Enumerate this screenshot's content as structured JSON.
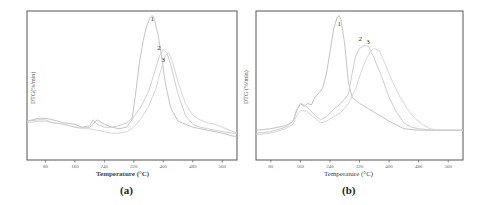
{
  "chart_data": [
    {
      "id": "a",
      "type": "line",
      "caption": "(a)",
      "title": "",
      "xlabel": "Temperature (°C)",
      "ylabel": "DTG(%/min)",
      "xlim": [
        30,
        600
      ],
      "ylim": [
        0,
        100
      ],
      "xticks": [
        80,
        160,
        240,
        320,
        400,
        480,
        560
      ],
      "grid": false,
      "legend": "inline numeric labels near peaks",
      "series": [
        {
          "name": "1",
          "label_position": [
            370,
            93
          ],
          "x": [
            30,
            60,
            80,
            100,
            130,
            160,
            180,
            200,
            210,
            220,
            240,
            260,
            280,
            300,
            315,
            325,
            335,
            345,
            355,
            365,
            370,
            375,
            385,
            395,
            405,
            420,
            440,
            460,
            480,
            500,
            520,
            540,
            560,
            590,
            600
          ],
          "y": [
            26,
            28,
            28,
            27,
            25,
            24,
            22,
            22,
            24,
            27,
            24,
            22,
            21,
            22,
            27,
            45,
            65,
            80,
            90,
            96,
            97,
            95,
            85,
            70,
            52,
            35,
            26,
            24,
            22,
            21,
            20,
            19,
            18,
            16,
            16
          ]
        },
        {
          "name": "2",
          "label_position": [
            388,
            74
          ],
          "x": [
            30,
            60,
            80,
            100,
            130,
            160,
            180,
            200,
            210,
            220,
            240,
            260,
            280,
            300,
            320,
            340,
            360,
            375,
            390,
            400,
            410,
            420,
            440,
            460,
            480,
            500,
            520,
            540,
            560,
            590,
            600
          ],
          "y": [
            26,
            27,
            27,
            25,
            24,
            22,
            22,
            23,
            27,
            24,
            22,
            22,
            23,
            25,
            29,
            36,
            46,
            58,
            70,
            74,
            72,
            64,
            44,
            30,
            24,
            22,
            21,
            20,
            19,
            18,
            18
          ]
        },
        {
          "name": "3",
          "label_position": [
            400,
            66
          ],
          "x": [
            30,
            60,
            80,
            100,
            130,
            160,
            180,
            200,
            220,
            240,
            260,
            280,
            300,
            320,
            340,
            360,
            380,
            395,
            405,
            415,
            425,
            440,
            460,
            480,
            500,
            520,
            540,
            560,
            590,
            600
          ],
          "y": [
            25,
            26,
            26,
            25,
            24,
            22,
            21,
            21,
            20,
            19,
            18,
            18,
            19,
            22,
            28,
            36,
            48,
            62,
            70,
            72,
            66,
            52,
            38,
            30,
            27,
            25,
            24,
            22,
            19,
            18
          ]
        }
      ]
    },
    {
      "id": "b",
      "type": "line",
      "caption": "(b)",
      "title": "",
      "xlabel": "Temperature (°C)",
      "ylabel": "DTG (%/min)",
      "xlim": [
        40,
        600
      ],
      "ylim": [
        0,
        100
      ],
      "xticks": [
        80,
        160,
        240,
        320,
        400,
        480,
        560
      ],
      "grid": false,
      "legend": "inline numeric labels near peaks",
      "series": [
        {
          "name": "1",
          "label_position": [
            265,
            90
          ],
          "x": [
            40,
            80,
            120,
            140,
            150,
            160,
            170,
            180,
            190,
            200,
            210,
            220,
            230,
            240,
            250,
            260,
            265,
            270,
            280,
            290,
            300,
            320,
            360,
            400,
            440,
            480,
            520,
            560,
            600
          ],
          "y": [
            20,
            21,
            23,
            26,
            33,
            38,
            36,
            38,
            37,
            42,
            45,
            48,
            57,
            72,
            88,
            96,
            97,
            94,
            78,
            52,
            42,
            38,
            32,
            26,
            21,
            20,
            20,
            20,
            20
          ],
          "note": "sharp main peak ~265 °C"
        },
        {
          "name": "2",
          "label_position": [
            322,
            80
          ],
          "x": [
            40,
            80,
            120,
            140,
            150,
            160,
            170,
            180,
            200,
            215,
            230,
            250,
            270,
            290,
            300,
            310,
            320,
            335,
            345,
            360,
            380,
            400,
            420,
            440,
            460,
            480,
            520,
            560,
            600
          ],
          "y": [
            18,
            19,
            22,
            26,
            34,
            38,
            37,
            35,
            30,
            27,
            29,
            34,
            38,
            44,
            58,
            70,
            75,
            77,
            76,
            68,
            56,
            42,
            32,
            25,
            22,
            21,
            20,
            20,
            20
          ]
        },
        {
          "name": "3",
          "label_position": [
            343,
            78
          ],
          "x": [
            40,
            80,
            120,
            140,
            150,
            160,
            170,
            180,
            200,
            215,
            230,
            250,
            270,
            290,
            310,
            320,
            335,
            350,
            360,
            375,
            390,
            410,
            430,
            450,
            470,
            490,
            510,
            530,
            560,
            600
          ],
          "y": [
            17,
            18,
            21,
            24,
            30,
            33,
            33,
            32,
            28,
            25,
            26,
            29,
            32,
            38,
            48,
            56,
            66,
            73,
            75,
            73,
            64,
            52,
            42,
            34,
            28,
            24,
            21,
            20,
            20,
            20
          ]
        }
      ]
    }
  ],
  "panels": {
    "a": {
      "caption": "(a)",
      "xlabel": "Temperature (°C)",
      "ylabel": "DTG(%/min)"
    },
    "b": {
      "caption": "(b)",
      "xlabel": "Temperature (°C)",
      "ylabel": "DTG (%/min)"
    }
  },
  "colors": {
    "frame": "#555555",
    "series": [
      "#bcbcbc",
      "#c8c8c8",
      "#d2d2d2"
    ]
  }
}
